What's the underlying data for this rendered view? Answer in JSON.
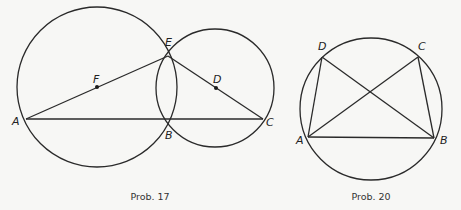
{
  "figures": [
    {
      "caption": "Prob. 17",
      "circles": [
        {
          "center": "F",
          "cx": 97,
          "cy": 87,
          "r": 80
        },
        {
          "center": "D",
          "cx": 215,
          "cy": 88,
          "r": 59
        }
      ],
      "points": {
        "A": {
          "label": "A",
          "x": 26,
          "y": 119
        },
        "B": {
          "label": "B",
          "x": 169,
          "y": 120
        },
        "C": {
          "label": "C",
          "x": 263,
          "y": 119
        },
        "E": {
          "label": "E",
          "x": 168,
          "y": 56
        },
        "F": {
          "label": "F",
          "x": 97,
          "y": 87
        },
        "D": {
          "label": "D",
          "x": 216,
          "y": 88
        }
      },
      "segments": [
        [
          "A",
          "C"
        ],
        [
          "A",
          "E"
        ],
        [
          "E",
          "C"
        ]
      ]
    },
    {
      "caption": "Prob. 20",
      "circles": [
        {
          "center": "",
          "cx": 371,
          "cy": 109,
          "r": 71
        }
      ],
      "points": {
        "A": {
          "label": "A",
          "x": 308,
          "y": 137
        },
        "B": {
          "label": "B",
          "x": 434,
          "y": 138
        },
        "C": {
          "label": "C",
          "x": 418,
          "y": 57
        },
        "D": {
          "label": "D",
          "x": 322,
          "y": 57
        }
      },
      "segments": [
        [
          "A",
          "B"
        ],
        [
          "A",
          "D"
        ],
        [
          "B",
          "C"
        ],
        [
          "A",
          "C"
        ],
        [
          "B",
          "D"
        ]
      ]
    }
  ]
}
